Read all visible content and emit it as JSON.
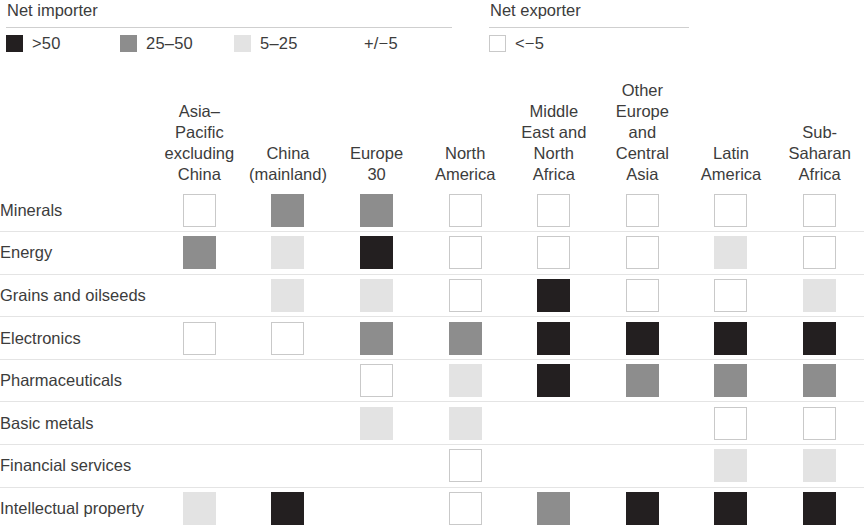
{
  "legend": {
    "importer": {
      "title": "Net importer",
      "items": [
        {
          "label": ">50",
          "swatch": "swatch-gt50",
          "fill": "#231f20",
          "border": "none"
        },
        {
          "label": "25–50",
          "swatch": "swatch-25-50",
          "fill": "#8d8d8d",
          "border": "none"
        },
        {
          "label": "5–25",
          "swatch": "swatch-5-25",
          "fill": "#e3e3e3",
          "border": "none"
        },
        {
          "label": "+/−5",
          "swatch": "swatch-plusminus5",
          "fill": "none",
          "border": "none"
        }
      ]
    },
    "exporter": {
      "title": "Net exporter",
      "items": [
        {
          "label": "<−5",
          "swatch": "swatch-lt-minus5",
          "fill": "#ffffff",
          "border": "#c9c9c9"
        }
      ]
    }
  },
  "colors": {
    "gt50": "#231f20",
    "v25_50": "#8d8d8d",
    "v5_25": "#e3e3e3",
    "pm5": "none",
    "lt_minus5_fill": "#ffffff",
    "lt_minus5_border": "#c9c9c9",
    "rule": "#cfcfcf",
    "row_divider": "#e4e4e4",
    "text": "#3c3c3c"
  },
  "chart_data": {
    "type": "heatmap",
    "title": "",
    "xlabel": "",
    "ylabel": "",
    "legend_position": "top",
    "grid": true,
    "categories": [
      "Asia–Pacific excluding China",
      "China (mainland)",
      "Europe 30",
      "North America",
      "Middle East and North Africa",
      "Other Europe and Central Asia",
      "Latin America",
      "Sub-Saharan Africa"
    ],
    "column_header_lines": [
      [
        "Asia–Pacific",
        "excluding",
        "China"
      ],
      [
        "China",
        "(mainland)"
      ],
      [
        "Europe",
        "30"
      ],
      [
        "North",
        "America"
      ],
      [
        "Middle",
        "East and",
        "North",
        "Africa"
      ],
      [
        "Other",
        "Europe",
        "and",
        "Central",
        "Asia"
      ],
      [
        "Latin",
        "America"
      ],
      [
        "Sub-",
        "Saharan",
        "Africa"
      ]
    ],
    "rows": [
      "Minerals",
      "Energy",
      "Grains and oilseeds",
      "Electronics",
      "Pharmaceuticals",
      "Basic metals",
      "Financial services",
      "Intellectual property"
    ],
    "value_levels": {
      "gt50": ">50",
      "v25_50": "25–50",
      "v5_25": "5–25",
      "pm5": "+/−5",
      "lt_minus5": "<−5"
    },
    "values": [
      [
        "lt_minus5",
        "v25_50",
        "v25_50",
        "lt_minus5",
        "lt_minus5",
        "lt_minus5",
        "lt_minus5",
        "lt_minus5"
      ],
      [
        "v25_50",
        "v5_25",
        "gt50",
        "lt_minus5",
        "lt_minus5",
        "lt_minus5",
        "v5_25",
        "lt_minus5"
      ],
      [
        "pm5",
        "v5_25",
        "v5_25",
        "lt_minus5",
        "gt50",
        "lt_minus5",
        "lt_minus5",
        "v5_25"
      ],
      [
        "lt_minus5",
        "lt_minus5",
        "v25_50",
        "v25_50",
        "gt50",
        "gt50",
        "gt50",
        "gt50"
      ],
      [
        "pm5",
        "pm5",
        "lt_minus5",
        "v5_25",
        "gt50",
        "v25_50",
        "v25_50",
        "v25_50"
      ],
      [
        "pm5",
        "pm5",
        "v5_25",
        "v5_25",
        "pm5",
        "pm5",
        "lt_minus5",
        "lt_minus5"
      ],
      [
        "pm5",
        "pm5",
        "pm5",
        "lt_minus5",
        "pm5",
        "pm5",
        "v5_25",
        "v5_25"
      ],
      [
        "v5_25",
        "gt50",
        "pm5",
        "lt_minus5",
        "v25_50",
        "gt50",
        "gt50",
        "gt50"
      ]
    ]
  }
}
